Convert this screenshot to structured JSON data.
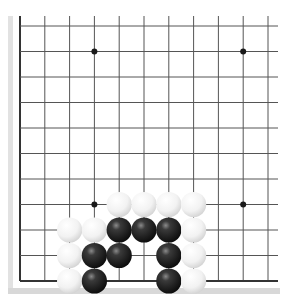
{
  "board": {
    "type": "go-board-fragment",
    "columns_visible": 11,
    "rows_visible": 11,
    "edges": [
      "left",
      "bottom"
    ],
    "colors": {
      "background": "#ffffff",
      "line": "#555555",
      "edge_line": "#333333",
      "frame_shadow": "#dcdcdc",
      "black_stone": "#1e1e1e",
      "white_stone": "#f4f4f4"
    },
    "star_points": [
      {
        "col": 3,
        "row": 1
      },
      {
        "col": 9,
        "row": 1
      },
      {
        "col": 3,
        "row": 7
      },
      {
        "col": 9,
        "row": 7
      }
    ],
    "stones": [
      {
        "color": "white",
        "col": 4,
        "row": 7
      },
      {
        "color": "white",
        "col": 5,
        "row": 7
      },
      {
        "color": "white",
        "col": 6,
        "row": 7
      },
      {
        "color": "white",
        "col": 7,
        "row": 7
      },
      {
        "color": "white",
        "col": 2,
        "row": 8
      },
      {
        "color": "white",
        "col": 3,
        "row": 8
      },
      {
        "color": "black",
        "col": 4,
        "row": 8
      },
      {
        "color": "black",
        "col": 5,
        "row": 8
      },
      {
        "color": "black",
        "col": 6,
        "row": 8
      },
      {
        "color": "white",
        "col": 7,
        "row": 8
      },
      {
        "color": "white",
        "col": 2,
        "row": 9
      },
      {
        "color": "black",
        "col": 3,
        "row": 9
      },
      {
        "color": "black",
        "col": 4,
        "row": 9
      },
      {
        "color": "black",
        "col": 6,
        "row": 9
      },
      {
        "color": "white",
        "col": 7,
        "row": 9
      },
      {
        "color": "white",
        "col": 2,
        "row": 10
      },
      {
        "color": "black",
        "col": 3,
        "row": 10
      },
      {
        "color": "black",
        "col": 6,
        "row": 10
      },
      {
        "color": "white",
        "col": 7,
        "row": 10
      }
    ]
  }
}
